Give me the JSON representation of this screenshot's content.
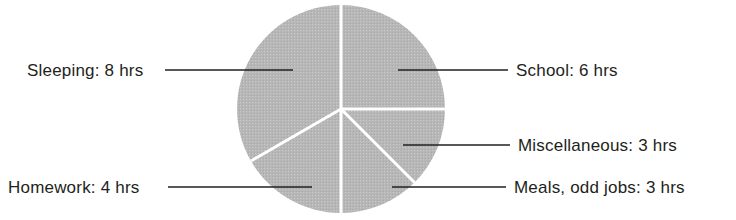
{
  "chart_data": {
    "type": "pie",
    "title": "",
    "unit": "hrs",
    "total": 24,
    "categories": [
      "School",
      "Miscellaneous",
      "Meals, odd jobs",
      "Homework",
      "Sleeping"
    ],
    "values": [
      6,
      3,
      3,
      4,
      8
    ],
    "labels": [
      "School: 6 hrs",
      "Miscellaneous: 3 hrs",
      "Meals, odd jobs: 3 hrs",
      "Homework: 4 hrs",
      "Sleeping: 8 hrs"
    ],
    "slices": [
      {
        "name": "School",
        "value": 6,
        "label": "School: 6 hrs",
        "start_angle": 0,
        "end_angle": 90,
        "sweep": 90,
        "fill": "#b7b7b7"
      },
      {
        "name": "Miscellaneous",
        "value": 3,
        "label": "Miscellaneous: 3 hrs",
        "start_angle": 90,
        "end_angle": 135,
        "sweep": 45,
        "fill": "#b7b7b7"
      },
      {
        "name": "Meals, odd jobs",
        "value": 3,
        "label": "Meals, odd jobs: 3 hrs",
        "start_angle": 135,
        "end_angle": 180,
        "sweep": 45,
        "fill": "#b7b7b7"
      },
      {
        "name": "Homework",
        "value": 4,
        "label": "Homework: 4 hrs",
        "start_angle": 180,
        "end_angle": 240,
        "sweep": 60,
        "fill": "#b7b7b7"
      },
      {
        "name": "Sleeping",
        "value": 8,
        "label": "Sleeping: 8 hrs",
        "start_angle": 240,
        "end_angle": 360,
        "sweep": 120,
        "fill": "#b7b7b7"
      }
    ],
    "colors": {
      "slice_fill": "#b7b7b7",
      "slice_divider": "#ffffff",
      "leader_line": "#231f20",
      "text": "#231f20",
      "background": "#ffffff"
    },
    "legend": "none",
    "grid": false,
    "geometry": {
      "center_x": 341,
      "center_y": 109,
      "radius": 104
    }
  },
  "labels": {
    "sleeping": "Sleeping: 8 hrs",
    "homework": "Homework: 4 hrs",
    "school": "School: 6 hrs",
    "miscellaneous": "Miscellaneous: 3 hrs",
    "meals": "Meals, odd jobs: 3 hrs"
  }
}
